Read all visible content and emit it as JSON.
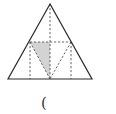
{
  "figure": {
    "colors": {
      "stroke": "#2a2a2a",
      "dashed": "#555555",
      "shade": "#d3d3d3"
    },
    "outer_triangle": [
      [
        50,
        4
      ],
      [
        8,
        79
      ],
      [
        92,
        79
      ]
    ],
    "shaded_triangle": [
      [
        30,
        42
      ],
      [
        50,
        42
      ],
      [
        50,
        79
      ]
    ],
    "dashed_lines": [
      [
        [
          30,
          42
        ],
        [
          71,
          42
        ]
      ],
      [
        [
          50,
          4
        ],
        [
          50,
          79
        ]
      ],
      [
        [
          30,
          42
        ],
        [
          30,
          79
        ]
      ],
      [
        [
          71,
          42
        ],
        [
          71,
          79
        ]
      ],
      [
        [
          30,
          42
        ],
        [
          50,
          79
        ]
      ],
      [
        [
          71,
          42
        ],
        [
          50,
          79
        ]
      ]
    ]
  },
  "caption": "("
}
